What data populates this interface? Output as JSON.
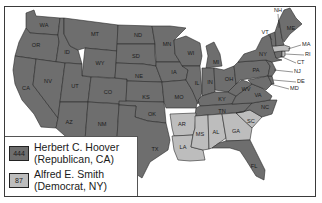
{
  "map": {
    "title": "",
    "colors": {
      "republican": "#6e6e6e",
      "democrat": "#bdbdbd",
      "background": "#ffffff",
      "border": "#2a2a2a"
    },
    "states": {
      "WA": {
        "label": "WA",
        "winner": "Hoover"
      },
      "OR": {
        "label": "OR",
        "winner": "Hoover"
      },
      "CA": {
        "label": "CA",
        "winner": "Hoover"
      },
      "ID": {
        "label": "ID",
        "winner": "Hoover"
      },
      "NV": {
        "label": "NV",
        "winner": "Hoover"
      },
      "MT": {
        "label": "MT",
        "winner": "Hoover"
      },
      "WY": {
        "label": "WY",
        "winner": "Hoover"
      },
      "UT": {
        "label": "UT",
        "winner": "Hoover"
      },
      "AZ": {
        "label": "AZ",
        "winner": "Hoover"
      },
      "CO": {
        "label": "CO",
        "winner": "Hoover"
      },
      "NM": {
        "label": "NM",
        "winner": "Hoover"
      },
      "ND": {
        "label": "ND",
        "winner": "Hoover"
      },
      "SD": {
        "label": "SD",
        "winner": "Hoover"
      },
      "NE": {
        "label": "NE",
        "winner": "Hoover"
      },
      "KS": {
        "label": "KS",
        "winner": "Hoover"
      },
      "OK": {
        "label": "OK",
        "winner": "Hoover"
      },
      "TX": {
        "label": "TX",
        "winner": "Hoover"
      },
      "MN": {
        "label": "MN",
        "winner": "Hoover"
      },
      "IA": {
        "label": "IA",
        "winner": "Hoover"
      },
      "MO": {
        "label": "MO",
        "winner": "Hoover"
      },
      "AR": {
        "label": "AR",
        "winner": "Smith"
      },
      "LA": {
        "label": "LA",
        "winner": "Smith"
      },
      "WI": {
        "label": "WI",
        "winner": "Hoover"
      },
      "IL": {
        "label": "IL",
        "winner": "Hoover"
      },
      "MI": {
        "label": "MI",
        "winner": "Hoover"
      },
      "IN": {
        "label": "IN",
        "winner": "Hoover"
      },
      "OH": {
        "label": "OH",
        "winner": "Hoover"
      },
      "KY": {
        "label": "KY",
        "winner": "Hoover"
      },
      "TN": {
        "label": "TN",
        "winner": "Hoover"
      },
      "MS": {
        "label": "MS",
        "winner": "Smith"
      },
      "AL": {
        "label": "AL",
        "winner": "Smith"
      },
      "GA": {
        "label": "GA",
        "winner": "Smith"
      },
      "FL": {
        "label": "FL",
        "winner": "Hoover"
      },
      "SC": {
        "label": "SC",
        "winner": "Smith"
      },
      "NC": {
        "label": "NC",
        "winner": "Hoover"
      },
      "VA": {
        "label": "VA",
        "winner": "Hoover"
      },
      "WV": {
        "label": "WV",
        "winner": "Hoover"
      },
      "PA": {
        "label": "PA",
        "winner": "Hoover"
      },
      "NY": {
        "label": "NY",
        "winner": "Hoover"
      },
      "VT": {
        "label": "VT",
        "winner": "Hoover"
      },
      "NH": {
        "label": "NH",
        "winner": "Hoover"
      },
      "ME": {
        "label": "ME",
        "winner": "Hoover"
      },
      "MA": {
        "label": "MA",
        "winner": "Smith"
      },
      "RI": {
        "label": "RI",
        "winner": "Smith"
      },
      "CT": {
        "label": "CT",
        "winner": "Hoover"
      },
      "NJ": {
        "label": "NJ",
        "winner": "Hoover"
      },
      "DE": {
        "label": "DE",
        "winner": "Hoover"
      },
      "MD": {
        "label": "MD",
        "winner": "Hoover"
      }
    }
  },
  "legend": {
    "items": [
      {
        "votes": "444",
        "line1": "Herbert C. Hoover",
        "line2": "(Republican, CA)",
        "color": "#6e6e6e"
      },
      {
        "votes": "87",
        "line1": "Alfred E. Smith",
        "line2": "(Democrat, NY)",
        "color": "#bdbdbd"
      }
    ]
  }
}
